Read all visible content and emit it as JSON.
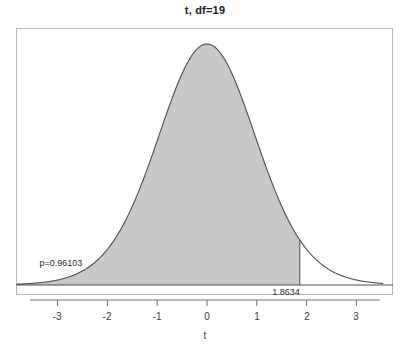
{
  "chart_data": {
    "type": "area",
    "title": "t, df=19",
    "xlabel": "t",
    "ylabel": "",
    "distribution": "Student t",
    "df": 19,
    "xlim": [
      -3.82,
      3.54
    ],
    "ylim": [
      0,
      0.4
    ],
    "xticks": [
      -3,
      -2,
      -1,
      0,
      1,
      2,
      3
    ],
    "xtick_labels": [
      "-3",
      "-2",
      "-1",
      "0",
      "1",
      "2",
      "3"
    ],
    "yticks": [],
    "grid": false,
    "legend": false,
    "shaded_region": {
      "from": -3.82,
      "to": 1.8634,
      "fill_color": "#c8c8c8",
      "area_probability": 0.96103
    },
    "annotations": [
      {
        "name": "p-value",
        "text": "p=0.96103",
        "x": -2.8,
        "y": 0.048
      },
      {
        "name": "cutoff",
        "text": "1.8634",
        "x": 1.8634,
        "y": 0
      }
    ],
    "cutoff_value": 1.8634,
    "p_value": 0.96103,
    "x": [
      -3.8,
      -3.6,
      -3.4,
      -3.2,
      -3.0,
      -2.8,
      -2.6,
      -2.4,
      -2.2,
      -2.0,
      -1.8,
      -1.6,
      -1.4,
      -1.2,
      -1.0,
      -0.8,
      -0.6,
      -0.4,
      -0.2,
      0.0,
      0.2,
      0.4,
      0.6,
      0.8,
      1.0,
      1.2,
      1.4,
      1.6,
      1.8,
      1.8634,
      2.0,
      2.2,
      2.4,
      2.6,
      2.8,
      3.0,
      3.2,
      3.4
    ],
    "y": [
      0.0023,
      0.0033,
      0.0047,
      0.0068,
      0.0098,
      0.0141,
      0.0203,
      0.0291,
      0.0414,
      0.058,
      0.08,
      0.108,
      0.1421,
      0.1813,
      0.2236,
      0.2658,
      0.3038,
      0.3336,
      0.3519,
      0.3582,
      0.3519,
      0.3336,
      0.3038,
      0.2658,
      0.2236,
      0.1813,
      0.1421,
      0.108,
      0.08,
      0.074,
      0.058,
      0.0414,
      0.0291,
      0.0203,
      0.0141,
      0.0098,
      0.0068,
      0.0047
    ],
    "colors": {
      "fill": "#c8c8c8",
      "curve_stroke": "#4d4d4d",
      "frame": "#b9b9b9",
      "axis": "#6e6e6e",
      "text": "#2b2b2b",
      "background": "#ffffff"
    }
  },
  "labels": {
    "title": "t, df=19",
    "x_axis": "t",
    "p_value_text": "p=0.96103",
    "cutoff_text": "1.8634",
    "tick_minus3": "-3",
    "tick_minus2": "-2",
    "tick_minus1": "-1",
    "tick_0": "0",
    "tick_1": "1",
    "tick_2": "2",
    "tick_3": "3"
  }
}
